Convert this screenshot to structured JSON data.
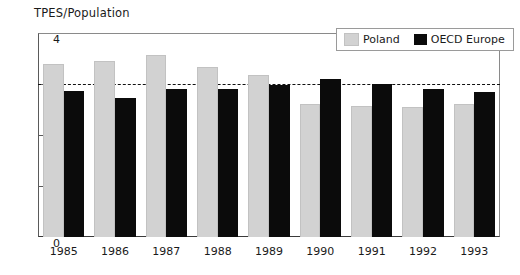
{
  "chart_data": {
    "type": "bar",
    "title": "TPES/Population",
    "xlabel": "",
    "ylabel": "",
    "ylim": [
      0,
      4
    ],
    "yticks": [
      0,
      1,
      2,
      3,
      4
    ],
    "ytick_labels": [
      "0",
      "1",
      "2",
      "3",
      "4"
    ],
    "grid": false,
    "legend_position": "top-right",
    "reference_line": {
      "value": 3,
      "style": "dashed",
      "color": "#111111"
    },
    "categories": [
      "1985",
      "1986",
      "1987",
      "1988",
      "1989",
      "1990",
      "1991",
      "1992",
      "1993"
    ],
    "series": [
      {
        "name": "Poland",
        "color": "#d2d2d2",
        "values": [
          3.4,
          3.45,
          3.57,
          3.33,
          3.17,
          2.61,
          2.57,
          2.55,
          2.6
        ]
      },
      {
        "name": "OECD Europe",
        "color": "#0b0b0b",
        "values": [
          2.87,
          2.73,
          2.91,
          2.9,
          2.99,
          3.1,
          3.0,
          2.9,
          2.84
        ]
      }
    ]
  },
  "legend": {
    "entries": [
      {
        "label": "Poland",
        "swatch": "poland"
      },
      {
        "label": "OECD Europe",
        "swatch": "oecd"
      }
    ]
  }
}
